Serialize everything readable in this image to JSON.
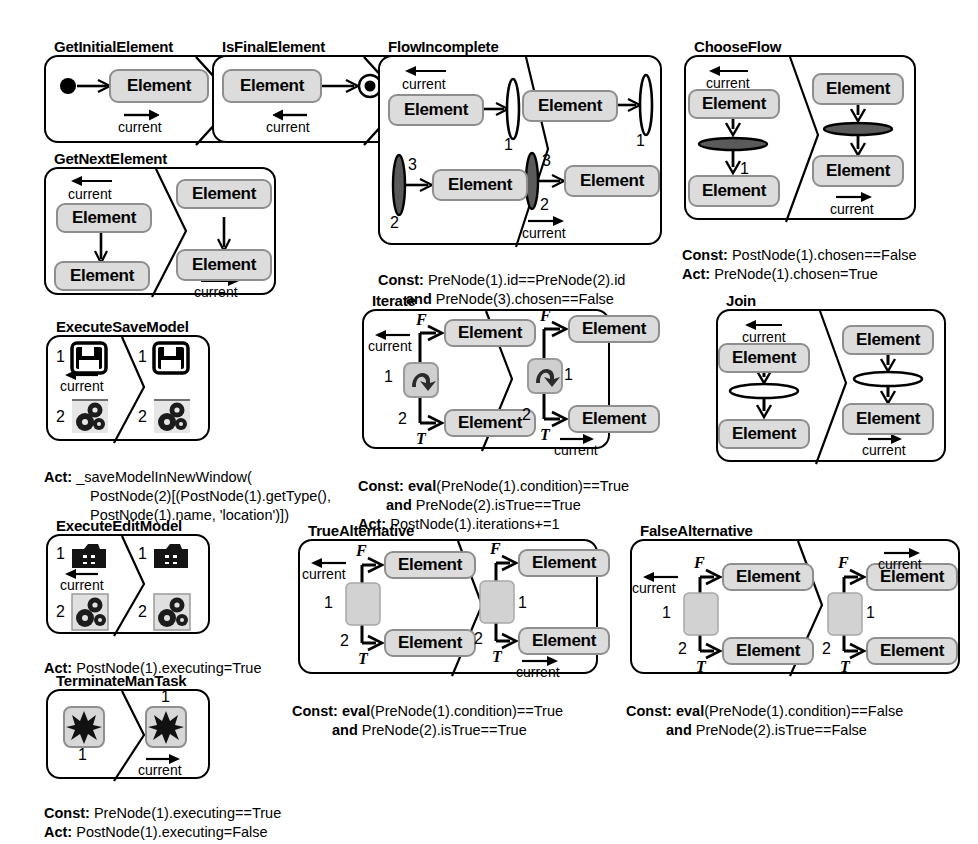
{
  "figure": {
    "type": "graph-transformation-rule-set",
    "element_label": "Element",
    "current_label": "current"
  },
  "rules": [
    {
      "id": "GetInitialElement",
      "title": "GetInitialElement",
      "lhs": {
        "nodes": [
          "initial-node",
          "Element"
        ],
        "edge_labels": []
      },
      "rhs": {
        "edge_labels": [
          "current"
        ]
      },
      "labels": {
        "current": "current"
      },
      "footer": []
    },
    {
      "id": "IsFinalElement",
      "title": "IsFinalElement",
      "lhs": {
        "nodes": [
          "Element",
          "final-node"
        ]
      },
      "labels": {
        "current": "current"
      },
      "footer": []
    },
    {
      "id": "GetNextElement",
      "title": "GetNextElement",
      "lhs": {
        "nodes": [
          "Element",
          "Element"
        ],
        "current": "current"
      },
      "rhs": {
        "nodes": [
          "Element",
          "Element"
        ],
        "current": "current"
      },
      "footer": []
    },
    {
      "id": "FlowIncomplete",
      "title": "FlowIncomplete",
      "lhs": {
        "nodes": [
          "Element",
          "Element"
        ],
        "current": "current",
        "bars": [
          "1",
          "2",
          "3"
        ]
      },
      "rhs": {
        "nodes": [
          "Element",
          "Element"
        ],
        "current": "current",
        "bars": [
          "1",
          "2",
          "3"
        ]
      },
      "footer": [
        {
          "key": "Const:",
          "text": "PreNode(1).id==PreNode(2).id"
        },
        {
          "key": "and",
          "text": "PreNode(3).chosen==False",
          "indent": true
        }
      ]
    },
    {
      "id": "ChooseFlow",
      "title": "ChooseFlow",
      "lhs": {
        "nodes": [
          "Element",
          "Element"
        ],
        "current": "current",
        "bar_label": "1"
      },
      "rhs": {
        "nodes": [
          "Element",
          "Element"
        ],
        "current": "current"
      },
      "footer": [
        {
          "key": "Const:",
          "text": "PostNode(1).chosen==False"
        },
        {
          "key": "Act:",
          "text": "PreNode(1).chosen=True"
        }
      ]
    },
    {
      "id": "ExecuteSaveModel",
      "title": "ExecuteSaveModel",
      "lhs": {
        "numbers": [
          "1",
          "2"
        ],
        "icons": [
          "save-icon",
          "gears-icon"
        ],
        "current": "current"
      },
      "rhs": {
        "numbers": [
          "1",
          "2"
        ],
        "icons": [
          "save-icon",
          "gears-icon"
        ]
      },
      "footer": [
        {
          "key": "Act:",
          "text": "_saveModelInNewWindow("
        },
        {
          "key": "",
          "text": "PostNode(2)[(PostNode(1).getType(),",
          "indent": true
        },
        {
          "key": "",
          "text": "PostNode(1).name, 'location')])",
          "indent": true
        }
      ]
    },
    {
      "id": "ExecuteEditModel",
      "title": "ExecuteEditModel",
      "lhs": {
        "numbers": [
          "1",
          "2"
        ],
        "icons": [
          "edit-folder-icon",
          "gears-icon"
        ],
        "current": "current"
      },
      "rhs": {
        "numbers": [
          "1",
          "2"
        ],
        "icons": [
          "edit-folder-icon",
          "gears-icon"
        ]
      },
      "footer": [
        {
          "key": "Act:",
          "text": "PostNode(1).executing=True"
        }
      ]
    },
    {
      "id": "TerminateManTask",
      "title": "TerminateManTask",
      "lhs": {
        "numbers": [
          "1"
        ],
        "icons": [
          "burst-icon"
        ]
      },
      "rhs": {
        "numbers": [
          "1"
        ],
        "icons": [
          "burst-icon"
        ],
        "current": "current"
      },
      "footer": [
        {
          "key": "Const:",
          "text": "PreNode(1).executing==True"
        },
        {
          "key": "Act:",
          "text": "PostNode(1).executing=False"
        }
      ]
    },
    {
      "id": "Iterate",
      "title": "Iterate",
      "lhs": {
        "nodes": [
          "Element",
          "Element"
        ],
        "branches": [
          "F",
          "T"
        ],
        "numbers": [
          "1",
          "2"
        ],
        "current": "current",
        "icon": "loop-icon"
      },
      "rhs": {
        "nodes": [
          "Element",
          "Element"
        ],
        "branches": [
          "F",
          "T"
        ],
        "numbers": [
          "1",
          "2"
        ],
        "current": "current",
        "icon": "loop-icon"
      },
      "footer": [
        {
          "key": "Const:",
          "text": "eval(PreNode(1).condition)==True",
          "bold_fn": "eval"
        },
        {
          "key": "and",
          "text": "PreNode(2).isTrue==True",
          "indent": true
        },
        {
          "key": "Act:",
          "text": "PostNode(1).iterations+=1"
        }
      ]
    },
    {
      "id": "Join",
      "title": "Join",
      "lhs": {
        "nodes": [
          "Element",
          "Element"
        ],
        "current": "current"
      },
      "rhs": {
        "nodes": [
          "Element",
          "Element"
        ],
        "current": "current"
      },
      "footer": []
    },
    {
      "id": "TrueAlternative",
      "title": "TrueAlternative",
      "lhs": {
        "nodes": [
          "Element",
          "Element"
        ],
        "branches": [
          "F",
          "T"
        ],
        "numbers": [
          "1",
          "2"
        ],
        "current": "current"
      },
      "rhs": {
        "nodes": [
          "Element",
          "Element"
        ],
        "branches": [
          "F",
          "T"
        ],
        "numbers": [
          "1",
          "2"
        ],
        "current": "current"
      },
      "footer": [
        {
          "key": "Const:",
          "text": "eval(PreNode(1).condition)==True"
        },
        {
          "key": "and",
          "text": "PreNode(2).isTrue==True",
          "indent": true
        }
      ]
    },
    {
      "id": "FalseAlternative",
      "title": "FalseAlternative",
      "lhs": {
        "nodes": [
          "Element",
          "Element"
        ],
        "branches": [
          "F",
          "T"
        ],
        "numbers": [
          "1",
          "2"
        ],
        "current": "current"
      },
      "rhs": {
        "nodes": [
          "Element",
          "Element"
        ],
        "branches": [
          "F",
          "T"
        ],
        "numbers": [
          "1",
          "2"
        ],
        "current": "current"
      },
      "footer": [
        {
          "key": "Const:",
          "text": "eval(PreNode(1).condition)==False"
        },
        {
          "key": "and",
          "text": "PreNode(2).isTrue==False",
          "indent": true
        }
      ]
    }
  ],
  "text": {
    "element": "Element",
    "current": "current",
    "F": "F",
    "T": "T",
    "n1": "1",
    "n2": "2",
    "n3": "3",
    "t_getinitial": "GetInitialElement",
    "t_isfinal": "IsFinalElement",
    "t_getnext": "GetNextElement",
    "t_flowincomplete": "FlowIncomplete",
    "t_chooseflow": "ChooseFlow",
    "t_executesave": "ExecuteSaveModel",
    "t_executeedit": "ExecuteEditModel",
    "t_terminate": "TerminateManTask",
    "t_iterate": "Iterate",
    "t_join": "Join",
    "t_truealt": "TrueAlternative",
    "t_falsealt": "FalseAlternative",
    "fi_c1k": "Const:",
    "fi_c1": " PreNode(1).id==PreNode(2).id",
    "fi_c2k": "and",
    "fi_c2": " PreNode(3).chosen==False",
    "cf_c1k": "Const:",
    "cf_c1": " PostNode(1).chosen==False",
    "cf_a1k": "Act:",
    "cf_a1": " PreNode(1).chosen=True",
    "es_a1k": "Act:",
    "es_a1": " _saveModelInNewWindow(",
    "es_a2": "PostNode(2)[(PostNode(1).getType(),",
    "es_a3": "PostNode(1).name, 'location')])",
    "ee_a1k": "Act:",
    "ee_a1": " PostNode(1).executing=True",
    "tm_c1k": "Const:",
    "tm_c1": " PreNode(1).executing==True",
    "tm_a1k": "Act:",
    "tm_a1": " PostNode(1).executing=False",
    "it_c1k": "Const:",
    "it_c1b": " eval",
    "it_c1": "(PreNode(1).condition)==True",
    "it_c2k": "and",
    "it_c2": " PreNode(2).isTrue==True",
    "it_a1k": "Act:",
    "it_a1": " PostNode(1).iterations+=1",
    "ta_c1k": "Const:",
    "ta_c1b": " eval",
    "ta_c1": "(PreNode(1).condition)==True",
    "ta_c2k": "and",
    "ta_c2": " PreNode(2).isTrue==True",
    "fa_c1k": "Const:",
    "fa_c1b": " eval",
    "fa_c1": "(PreNode(1).condition)==False",
    "fa_c2k": "and",
    "fa_c2": " PreNode(2).isTrue==False"
  },
  "colors": {
    "node_fill": "#dcdcdc",
    "node_stroke": "#8e8e8e",
    "outline": "#000000",
    "bar_dark": "#4a4a4a",
    "background": "#ffffff"
  }
}
